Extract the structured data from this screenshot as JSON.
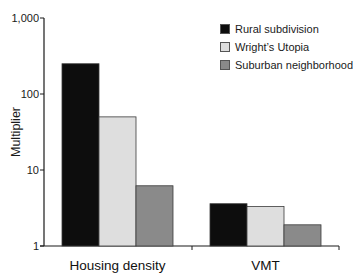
{
  "chart_data": {
    "type": "bar",
    "title": "",
    "xlabel": "",
    "ylabel": "Multiplier",
    "yscale": "log",
    "ylim": [
      1,
      1000
    ],
    "yticks": [
      1,
      10,
      100,
      1000
    ],
    "ytick_labels": [
      "1",
      "10",
      "100",
      "1,000"
    ],
    "grid": false,
    "legend_position": "top-right",
    "categories": [
      "Housing density",
      "VMT"
    ],
    "series": [
      {
        "name": "Rural subdivision",
        "color": "#0d0d0d",
        "values": [
          250,
          3.6
        ]
      },
      {
        "name": "Wright's Utopia",
        "color": "#dedede",
        "values": [
          50,
          3.3
        ]
      },
      {
        "name": "Suburban neighborhood",
        "color": "#8a8a8a",
        "values": [
          6.2,
          1.9
        ]
      }
    ]
  },
  "legend": {
    "items": [
      {
        "label": "Rural subdivision",
        "color": "#0d0d0d"
      },
      {
        "label": "Wright’s Utopia",
        "color": "#dedede"
      },
      {
        "label": "Suburban neighborhood",
        "color": "#8a8a8a"
      }
    ]
  }
}
